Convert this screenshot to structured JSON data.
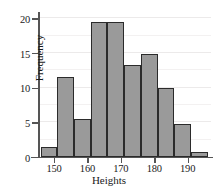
{
  "chart_data": {
    "type": "bar",
    "title": "",
    "xlabel": "Heights",
    "ylabel": "Frequency",
    "xlim": [
      145.5,
      197.0
    ],
    "ylim": [
      0,
      20.6
    ],
    "grid": true,
    "legend": "none",
    "bar_fill_color": "#9a9a9a",
    "bar_edge_color": "#2b2b2b",
    "xticks": [
      150,
      160,
      170,
      180,
      190
    ],
    "xtick_labels": [
      "150",
      "160",
      "170",
      "180",
      "190"
    ],
    "yticks": [
      0,
      5,
      10,
      15,
      20
    ],
    "ytick_labels": [
      "0",
      "5",
      "10",
      "15",
      "20"
    ],
    "bin_edges": [
      146.0,
      151.0,
      156.0,
      161.0,
      166.0,
      171.0,
      176.0,
      181.0,
      186.0,
      191.0,
      196.0
    ],
    "categories": [
      "146-151",
      "151-156",
      "156-161",
      "161-166",
      "166-171",
      "171-176",
      "176-181",
      "181-186",
      "186-191",
      "191-196"
    ],
    "values": [
      1.5,
      11.5,
      5.5,
      19.4,
      19.4,
      13.2,
      14.8,
      10.0,
      4.8,
      0.7
    ]
  }
}
